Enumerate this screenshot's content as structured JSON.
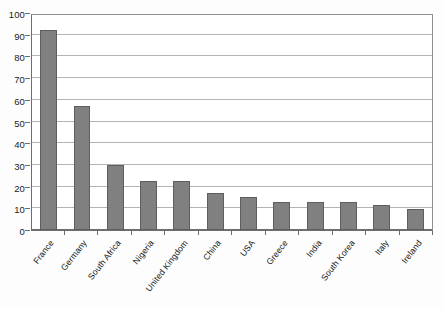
{
  "chart_data": {
    "type": "bar",
    "title": "",
    "subtitle": "",
    "xlabel": "",
    "ylabel": "",
    "categories": [
      "France",
      "Germany",
      "South Africa",
      "Nigeria",
      "United Kingdom",
      "China",
      "USA",
      "Greece",
      "India",
      "South Korea",
      "Italy",
      "Ireland"
    ],
    "values": [
      92,
      57,
      30,
      22.5,
      22.5,
      17,
      15,
      13,
      13,
      13,
      11.5,
      9.5
    ],
    "series": [
      {
        "name": "Series 1",
        "values": [
          92,
          57,
          30,
          22.5,
          22.5,
          17,
          15,
          13,
          13,
          13,
          11.5,
          9.5
        ]
      }
    ],
    "ylim": [
      0,
      100
    ],
    "ytick_values": [
      0,
      10,
      20,
      30,
      40,
      50,
      60,
      70,
      80,
      90,
      100
    ],
    "ytick_labels": [
      "0",
      "10",
      "20",
      "30",
      "40",
      "50",
      "60",
      "70",
      "80",
      "90",
      "100"
    ],
    "ytick_interval": 10,
    "grid": "horizontal",
    "legend": "none",
    "legend_position": "none",
    "bar_color": "#808080",
    "bar_border_color": "#5e5e5e",
    "gridline_color": "#b4b4b4",
    "axis_color": "#6e6e6e",
    "plot_background": "#ffffff",
    "figure_background": "#fdfdfd",
    "xtick_label_rotation": -52,
    "annotations": []
  }
}
